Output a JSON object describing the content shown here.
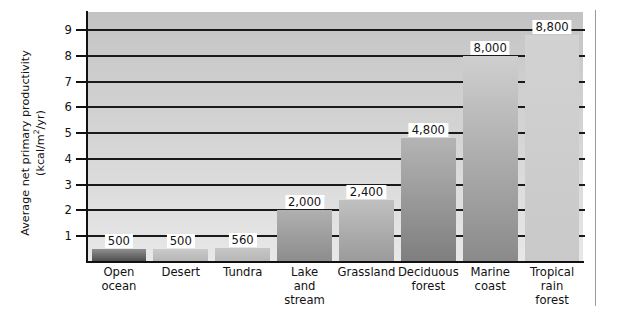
{
  "chart_data": {
    "type": "bar",
    "title": "",
    "xlabel": "",
    "ylabel_line1": "Average net primary productivity",
    "ylabel_line2_pre": "(kcal/m",
    "ylabel_line2_sup": "2",
    "ylabel_line2_post": "/yr)",
    "ylabel": "Average net primary productivity (kcal/m2/yr)",
    "ylim": [
      0,
      9700
    ],
    "ytick_values": [
      1,
      2,
      3,
      4,
      5,
      6,
      7,
      8,
      9
    ],
    "ytick_labels": [
      "1",
      "2",
      "3",
      "4",
      "5",
      "6",
      "7",
      "8",
      "9"
    ],
    "ytick_unit_multiplier": 1000,
    "grid": true,
    "grid_orientation": "horizontal",
    "legend": "none",
    "categories": [
      "Open ocean",
      "Desert",
      "Tundra",
      "Lake and stream",
      "Grassland",
      "Deciduous forest",
      "Marine coast",
      "Tropical rain forest"
    ],
    "category_lines": [
      [
        "Open",
        "ocean"
      ],
      [
        "Desert"
      ],
      [
        "Tundra"
      ],
      [
        "Lake",
        "and",
        "stream"
      ],
      [
        "Grassland"
      ],
      [
        "Deciduous",
        "forest"
      ],
      [
        "Marine",
        "coast"
      ],
      [
        "Tropical",
        "rain",
        "forest"
      ]
    ],
    "values": [
      500,
      500,
      560,
      2000,
      2400,
      4800,
      8000,
      8800
    ],
    "value_labels": [
      "500",
      "500",
      "560",
      "2,000",
      "2,400",
      "4,800",
      "8,000",
      "8,800"
    ],
    "bar_colors_top": [
      "#8f8f8f",
      "#cacaca",
      "#c6c6c6",
      "#b0b0b0",
      "#c0c0c0",
      "#b4b4b4",
      "#cfcfcf",
      "#d2d2d2"
    ],
    "bar_colors_bottom": [
      "#4a4a4a",
      "#b4b4b4",
      "#b6b6b6",
      "#8c8c8c",
      "#9a9a9a",
      "#7e7e7e",
      "#8a8a8a",
      "#c9c9c9"
    ],
    "plot_bg_top": "#c3c3c3",
    "plot_bg_bottom": "#e8e8e8",
    "axis_color": "#111111",
    "gridline_color": "#1a1a1a"
  }
}
